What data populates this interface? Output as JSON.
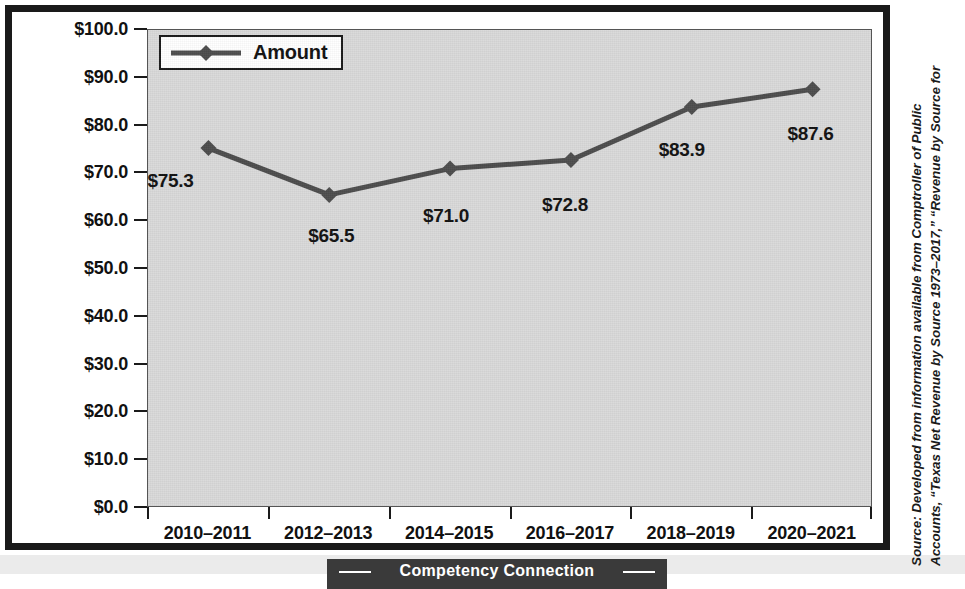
{
  "chart_data": {
    "type": "line",
    "title": "",
    "xlabel": "",
    "ylabel": "",
    "categories": [
      "2010–2011",
      "2012–2013",
      "2014–2015",
      "2016–2017",
      "2018–2019",
      "2020–2021"
    ],
    "series": [
      {
        "name": "Amount",
        "values": [
          75.3,
          65.5,
          71.0,
          72.8,
          83.9,
          87.6
        ],
        "point_labels": [
          "$75.3",
          "$65.5",
          "$71.0",
          "$72.8",
          "$83.9",
          "$87.6"
        ],
        "color": "#4d4d4d",
        "marker": "diamond"
      }
    ],
    "ylim": [
      0,
      100
    ],
    "ytick_step": 10,
    "ytick_labels": [
      "$100.0",
      "$90.0",
      "$80.0",
      "$70.0",
      "$60.0",
      "$50.0",
      "$40.0",
      "$30.0",
      "$20.0",
      "$10.0",
      "$0.0"
    ],
    "ytick_values": [
      100,
      90,
      80,
      70,
      60,
      50,
      40,
      30,
      20,
      10,
      0
    ],
    "grid": false,
    "legend": {
      "position": "top-left-inside",
      "entries": [
        "Amount"
      ]
    },
    "plot_background": "#d9d9d9",
    "frame_color": "#1a1a1a"
  },
  "legend": {
    "label": "Amount"
  },
  "source_note": {
    "line1": "Source: Developed from information available from Comptroller of Public",
    "line2": "Accounts, “Texas Net Revenue by Source 1973–2017,” “Revenue by Source for"
  },
  "banner": {
    "label": "Competency Connection"
  }
}
